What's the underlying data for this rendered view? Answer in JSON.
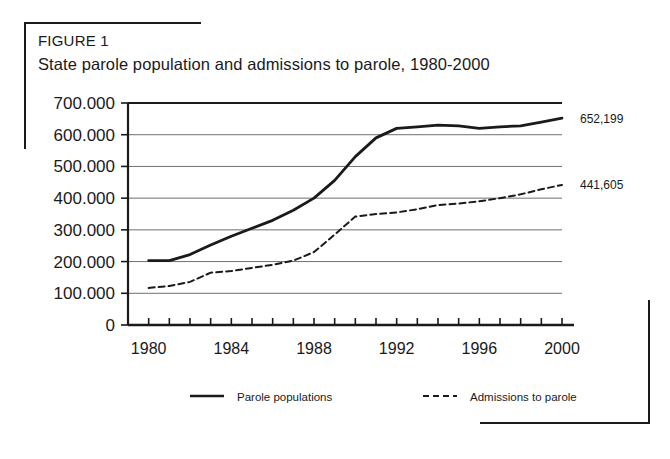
{
  "figure": {
    "label": "FIGURE 1",
    "title": "State parole population and admissions to parole, 1980-2000"
  },
  "legend": {
    "series_1_label": "Parole populations",
    "series_2_label": "Admissions to parole"
  },
  "endpoint_labels": {
    "parole_population": "652,199",
    "admissions": "441,605"
  },
  "colors": {
    "line": "#1a1a1a",
    "grid": "#6f6f6f",
    "axis": "#1a1a1a",
    "background": "#ffffff"
  },
  "chart_data": {
    "type": "line",
    "title": "State parole population and admissions to parole, 1980-2000",
    "xlabel": "",
    "ylabel": "",
    "xlim": [
      1979,
      2000
    ],
    "ylim": [
      0,
      700000
    ],
    "yticks": [
      0,
      100000,
      200000,
      300000,
      400000,
      500000,
      600000,
      700000
    ],
    "ytick_labels": [
      "0",
      "100.000",
      "200.000",
      "300.000",
      "400.000",
      "500.000",
      "600.000",
      "700.000"
    ],
    "xticks": [
      1980,
      1984,
      1988,
      1992,
      1996,
      2000
    ],
    "xtick_labels": [
      "1980",
      "1984",
      "1988",
      "1992",
      "1996",
      "2000"
    ],
    "minor_xticks_every": 1,
    "grid": "horizontal",
    "legend_position": "bottom",
    "x": [
      1980,
      1981,
      1982,
      1983,
      1984,
      1985,
      1986,
      1987,
      1988,
      1989,
      1990,
      1991,
      1992,
      1993,
      1994,
      1995,
      1996,
      1997,
      1998,
      1999,
      2000
    ],
    "series": [
      {
        "name": "Parole populations",
        "style": "solid",
        "end_label": "652,199",
        "values": [
          203000,
          203000,
          222000,
          252000,
          280000,
          305000,
          330000,
          362000,
          400000,
          456000,
          531000,
          590000,
          620000,
          625000,
          630000,
          628000,
          620000,
          625000,
          628000,
          640000,
          652199
        ]
      },
      {
        "name": "Admissions to parole",
        "style": "dashed",
        "end_label": "441,605",
        "values": [
          117000,
          123000,
          136000,
          165000,
          170000,
          180000,
          190000,
          203000,
          230000,
          285000,
          342000,
          350000,
          355000,
          365000,
          378000,
          383000,
          390000,
          400000,
          412000,
          428000,
          441605
        ]
      }
    ]
  }
}
